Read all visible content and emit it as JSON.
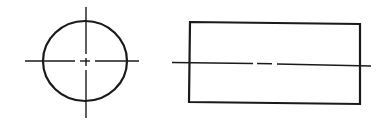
{
  "diagram": {
    "type": "orthographic-projection",
    "stroke_color": "#1a1a1a",
    "background": "#ffffff",
    "views": [
      {
        "name": "front-view",
        "shape": "circle",
        "cx": 85,
        "cy": 61,
        "rx": 42,
        "ry": 40,
        "center_lines": {
          "horizontal": {
            "x1": 25,
            "x2": 139,
            "y": 61,
            "gap_from": 76,
            "gap_to": 81,
            "dash_from": 81,
            "dash_to": 90,
            "gap2_to": 95
          },
          "vertical": {
            "x": 86,
            "y1": 7,
            "y2": 118,
            "gap_from": 54,
            "gap_to": 58,
            "dash_from": 58,
            "dash_to": 65,
            "gap2_to": 69
          }
        }
      },
      {
        "name": "side-view",
        "shape": "rectangle",
        "x": 190,
        "y": 22,
        "width": 170,
        "height": 80,
        "axis_line": {
          "x1": 172,
          "x2": 371,
          "y": 64,
          "segments": [
            [
              172,
              253
            ],
            [
              257,
              272
            ],
            [
              277,
              371
            ]
          ]
        }
      }
    ]
  }
}
